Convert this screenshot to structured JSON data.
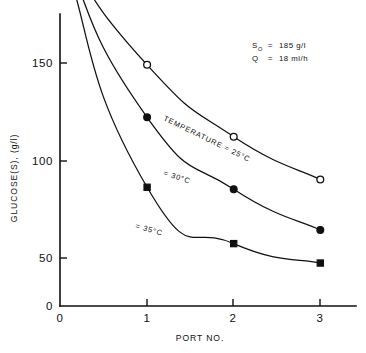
{
  "chart_data": {
    "type": "line",
    "title": "",
    "xlabel": "PORT NO.",
    "ylabel": "GLUCOSE(S), (g/l)",
    "x": [
      0,
      1,
      2,
      3
    ],
    "xtick_labels": [
      "0",
      "1",
      "2",
      "3"
    ],
    "ytick_labels": [
      "0",
      "50",
      "100",
      "150"
    ],
    "ytick_values": [
      0,
      50,
      100,
      150
    ],
    "xlim": [
      0,
      3.15
    ],
    "ylim": [
      0,
      196
    ],
    "grid": false,
    "legend_position": "inline-curve-labels",
    "series": [
      {
        "name": "TEMPERATURE = 25°C",
        "label": "TEMPERATURE = 25°C",
        "marker": "open-circle",
        "values": [
          185,
          124,
          87,
          65
        ]
      },
      {
        "name": "= 30°C",
        "label": "= 30°C",
        "marker": "filled-circle",
        "values": [
          185,
          97,
          60,
          39
        ]
      },
      {
        "name": "= 35°C",
        "label": "= 35°C",
        "marker": "filled-square",
        "values": [
          185,
          61,
          32,
          22
        ]
      }
    ],
    "annotations": [
      {
        "symbol": "S",
        "subscript": "O",
        "equals": "=",
        "value": "185 g/l"
      },
      {
        "symbol": "Q",
        "subscript": "",
        "equals": "=",
        "value": "18 ml/h"
      }
    ]
  },
  "axes": {
    "y_title": "GLUCOSE(S), (g/l)",
    "x_title": "PORT NO.",
    "y_ticks": [
      "150",
      "100",
      "50"
    ],
    "y_origin_label": "0",
    "x_ticks": [
      "0",
      "1",
      "2",
      "3"
    ]
  },
  "annotation_block": {
    "line1_symbol": "S",
    "line1_sub": "O",
    "line1_eq": "=",
    "line1_value": "185 g/l",
    "line2_symbol": "Q",
    "line2_eq": "=",
    "line2_value": "18 ml/h"
  },
  "curve_labels": {
    "top": "TEMPERATURE = 25°C",
    "middle": "= 30°C",
    "bottom": "= 35°C"
  },
  "colors": {
    "ink": "#101010",
    "background": "#ffffff"
  }
}
